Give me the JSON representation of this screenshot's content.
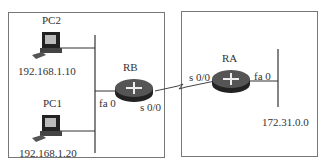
{
  "diagram": {
    "type": "network-topology",
    "areas": [
      {
        "name": "left-network"
      },
      {
        "name": "right-network"
      }
    ],
    "devices": {
      "pc2": {
        "label": "PC2",
        "ip": "192.168.1.10"
      },
      "pc1": {
        "label": "PC1",
        "ip": "192.168.1.20"
      },
      "rb": {
        "label": "RB",
        "lan_interface": "fa 0",
        "wan_interface": "s 0/0"
      },
      "ra": {
        "label": "RA",
        "lan_interface": "fa 0",
        "wan_interface": "s 0/0"
      }
    },
    "networks": {
      "ra_lan": "172.31.0.0"
    },
    "links": [
      {
        "from": "PC2",
        "to": "RB-LAN-segment"
      },
      {
        "from": "PC1",
        "to": "RB-LAN-segment"
      },
      {
        "from": "RB fa 0",
        "to": "RB-LAN-segment"
      },
      {
        "from": "RB s 0/0",
        "to": "RA s 0/0",
        "type": "serial"
      },
      {
        "from": "RA fa 0",
        "to": "172.31.0.0 segment"
      }
    ]
  }
}
